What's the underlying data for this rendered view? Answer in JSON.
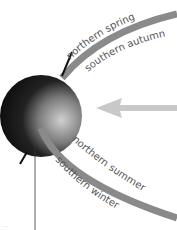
{
  "diagram": {
    "labels": {
      "northern_spring": "northern spring",
      "southern_autumn": "southern autumn",
      "northern_summer": "northern summer",
      "southern_winter": "southern winter",
      "footnote": "· · ·"
    },
    "colors": {
      "orbit": "#8a8a8a",
      "arrow": "#c8c8c8",
      "globe_dark": "#111111",
      "globe_light": "#aaaaaa",
      "text": "#555555"
    }
  }
}
